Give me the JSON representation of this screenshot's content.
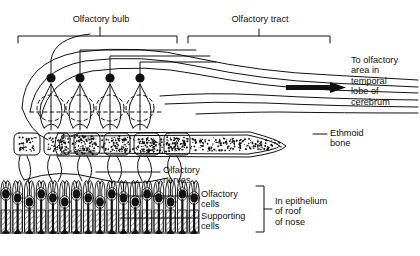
{
  "figure": {
    "title_alt": "Olfactory pathway: olfactory bulb, olfactory tract and olfactory epithelium",
    "ink_color": "#111111",
    "background_color": "#ffffff"
  },
  "labels": {
    "olfactory_bulb": "Olfactory bulb",
    "olfactory_tract": "Olfactory tract",
    "to_olfactory_area": "To olfactory\narea in\ntemporal\nlobe of\ncerebrum",
    "ethmoid_bone": "Ethmoid\nbone",
    "olfactory_nerves": "Olfactory\nnerves",
    "olfactory_cells": "Olfactory\ncells",
    "supporting_cells": "Supporting\ncells",
    "in_epithelium": "In epithelium\nof roof\nof nose"
  },
  "chart_data": {
    "type": "diagram",
    "parts": [
      {
        "name": "olfactory-bulb",
        "label": "Olfactory bulb",
        "bracket_x": [
          18,
          177
        ],
        "bracket_y": 36,
        "tick_x": 100
      },
      {
        "name": "olfactory-tract",
        "label": "Olfactory tract",
        "bracket_x": [
          188,
          330
        ],
        "bracket_y": 36,
        "tick_x": 259
      },
      {
        "name": "olfactory-tract-fibers",
        "count": 6
      },
      {
        "name": "mitral-cells",
        "count": 4,
        "soma_x": [
          51,
          80,
          110,
          140
        ],
        "soma_y": 78,
        "soma_r": 4.6
      },
      {
        "name": "glomeruli-dashed",
        "count": 4
      },
      {
        "name": "glomerular-boxes",
        "count": 6,
        "box_x": [
          14,
          44,
          74,
          104,
          134,
          164
        ],
        "box_y": 133
      },
      {
        "name": "ethmoid-bone",
        "stipple": true,
        "x": [
          56,
          285
        ],
        "y": [
          131,
          158
        ]
      },
      {
        "name": "olfactory-epithelium",
        "columns": 17,
        "y": [
          178,
          232
        ]
      },
      {
        "name": "cilia-fringe",
        "y": 233
      }
    ]
  }
}
